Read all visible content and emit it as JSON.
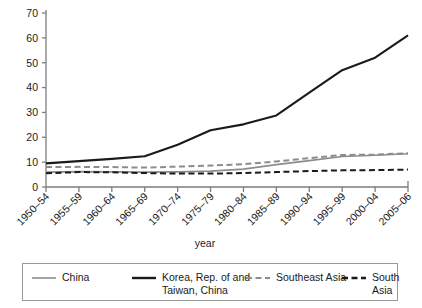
{
  "chart_data": {
    "type": "line",
    "title": "",
    "xlabel": "year",
    "ylabel": "",
    "ylim": [
      0,
      70
    ],
    "yticks": [
      0,
      10,
      20,
      30,
      40,
      50,
      60,
      70
    ],
    "grid": false,
    "legend_position": "bottom",
    "categories": [
      "1950–54",
      "1955–59",
      "1960–64",
      "1965–69",
      "1970–74",
      "1975–79",
      "1980–84",
      "1985–89",
      "1990–94",
      "1995–99",
      "2000–04",
      "2005–06"
    ],
    "series": [
      {
        "name": "China",
        "color": "#8c8c8c",
        "style": "solid",
        "width": 1.6,
        "values": [
          6.0,
          6.2,
          6.1,
          6.0,
          6.1,
          6.4,
          7.2,
          9.0,
          10.6,
          12.3,
          12.8,
          13.4
        ]
      },
      {
        "name": "Korea, Rep. of and Taiwan, China",
        "color": "#1a1a1a",
        "style": "solid",
        "width": 2.1,
        "values": [
          9.5,
          10.4,
          11.3,
          12.4,
          17.0,
          22.8,
          25.2,
          28.8,
          38.0,
          47.0,
          52.0,
          61.0
        ]
      },
      {
        "name": "Southeast Asia",
        "color": "#8c8c8c",
        "style": "dashed",
        "width": 2.0,
        "values": [
          8.0,
          8.1,
          8.0,
          7.8,
          8.2,
          8.6,
          9.2,
          10.3,
          11.6,
          12.9,
          13.0,
          13.6
        ]
      },
      {
        "name": "South Asia",
        "color": "#1a1a1a",
        "style": "dashed",
        "width": 2.0,
        "values": [
          5.5,
          6.0,
          5.9,
          5.6,
          5.4,
          5.4,
          5.6,
          6.0,
          6.4,
          6.7,
          6.8,
          7.0
        ]
      }
    ]
  },
  "legend": {
    "entries": [
      {
        "label": "China",
        "style": "solid",
        "color": "#8c8c8c",
        "width": 1.6
      },
      {
        "label": "Korea, Rep. of and\nTaiwan, China",
        "style": "solid",
        "color": "#1a1a1a",
        "width": 2.4
      },
      {
        "label": "Southeast Asia",
        "style": "dashed",
        "color": "#8c8c8c",
        "width": 2.2
      },
      {
        "label": "South Asia",
        "style": "dashed",
        "color": "#1a1a1a",
        "width": 2.4
      }
    ]
  }
}
